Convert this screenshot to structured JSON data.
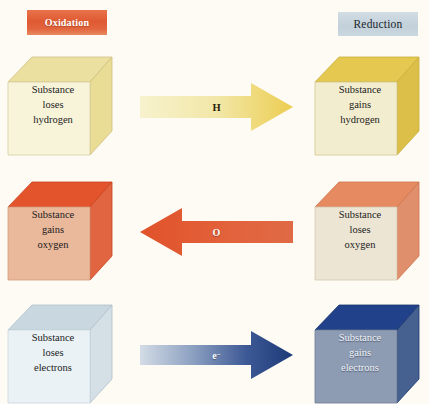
{
  "diagram": {
    "headers": {
      "oxidation": "Oxidation",
      "reduction": "Reduction",
      "oxidation_color": "#df5a33",
      "reduction_color": "#c2d0da"
    },
    "rows": [
      {
        "id": "hydrogen",
        "left_cube": {
          "line1": "Substance",
          "line2": "loses",
          "line3": "hydrogen",
          "face_color": "#f7f3d8",
          "top_color": "#ece0a0",
          "side_color": "#e7d98f"
        },
        "arrow": {
          "label": "H",
          "superscript": "",
          "direction": "right",
          "start_color": "#f6efc4",
          "end_color": "#eece55"
        },
        "right_cube": {
          "line1": "Substance",
          "line2": "gains",
          "line3": "hydrogen",
          "face_color": "#f2ecd0",
          "top_color": "#e3c killer",
          "side_color": "#d9bd4e"
        }
      },
      {
        "id": "oxygen",
        "left_cube": {
          "line1": "Substance",
          "line2": "gains",
          "line3": "oxygen",
          "face_color": "#eab89b",
          "top_color": "#e4542c",
          "side_color": "#e06a42"
        },
        "arrow": {
          "label": "O",
          "superscript": "",
          "direction": "left",
          "start_color": "#e05a33",
          "end_color": "#df6340"
        },
        "right_cube": {
          "line1": "Substance",
          "line2": "loses",
          "line3": "oxygen",
          "face_color": "#ece4d2",
          "top_color": "#e58a62",
          "side_color": "#e08d68"
        }
      },
      {
        "id": "electrons",
        "left_cube": {
          "line1": "Substance",
          "line2": "loses",
          "line3": "electrons",
          "face_color": "#e9f1f4",
          "top_color": "#c6d6de",
          "side_color": "#d2dee4"
        },
        "arrow": {
          "label": "e",
          "superscript": "−",
          "direction": "right",
          "start_color": "#ccd7e2",
          "end_color": "#1f3d7a"
        },
        "right_cube": {
          "line1": "Substance",
          "line2": "gains",
          "line3": "electrons",
          "face_color": "#8e9cb3",
          "top_color": "#21418a",
          "side_color": "#4a6290"
        }
      }
    ]
  }
}
